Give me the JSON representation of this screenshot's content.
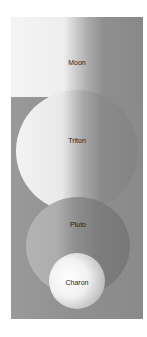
{
  "diagram": {
    "type": "size-comparison",
    "bodies": [
      {
        "name": "Moon",
        "shading": "white-to-gray"
      },
      {
        "name": "Triton",
        "shading": "white-to-gray"
      },
      {
        "name": "Pluto",
        "shading": "gray"
      },
      {
        "name": "Charon",
        "shading": "bright-white"
      }
    ]
  },
  "colors": {
    "panel": "#8f8f8f",
    "highlight": "#f4f4f4",
    "shadow": "#878787",
    "label": "#1e1e1e"
  }
}
